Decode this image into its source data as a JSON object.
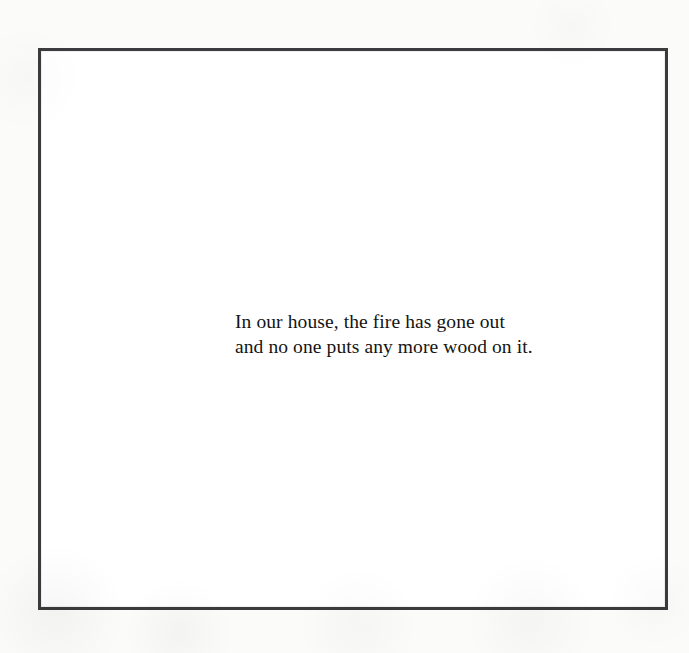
{
  "page": {
    "background_color": "#fbfbfa",
    "width": 689,
    "height": 653
  },
  "frame": {
    "name": "bordered-plate",
    "border_color": "#3b3b3d",
    "border_width_px": 3,
    "fill_color": "#ffffff"
  },
  "caption": {
    "color": "#141414",
    "lines": [
      "In our house, the fire has gone out",
      "and no one puts any more wood on it."
    ]
  }
}
